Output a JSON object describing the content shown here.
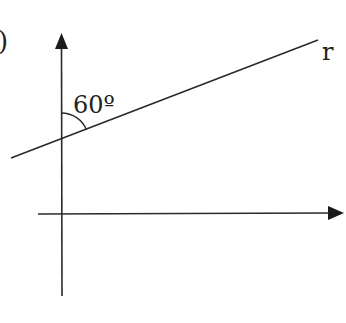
{
  "figure": {
    "item_marker": ")",
    "angle_label": "60º",
    "line_label": "r",
    "angle_degrees": 60,
    "colors": {
      "stroke": "#2a2a2a",
      "background": "#ffffff"
    }
  }
}
